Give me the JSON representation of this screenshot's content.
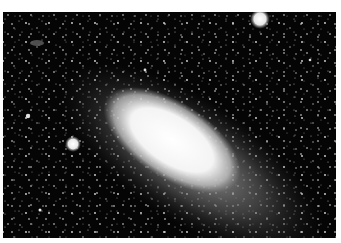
{
  "image": {
    "subject": "spiral galaxy with star field",
    "style": "black-and-white astrophotograph",
    "colors": {
      "background": "#050505",
      "core": "#ffffff",
      "halo": "#8a8a8a",
      "border": "#ffffff"
    },
    "features": [
      {
        "name": "galaxy-core",
        "cx": 170,
        "cy": 142
      },
      {
        "name": "companion-galaxy-top-right",
        "cx": 260,
        "cy": 19
      },
      {
        "name": "companion-galaxy-left",
        "cx": 73,
        "cy": 144
      },
      {
        "name": "faint-galaxy-top-left",
        "cx": 37,
        "cy": 43
      }
    ]
  }
}
